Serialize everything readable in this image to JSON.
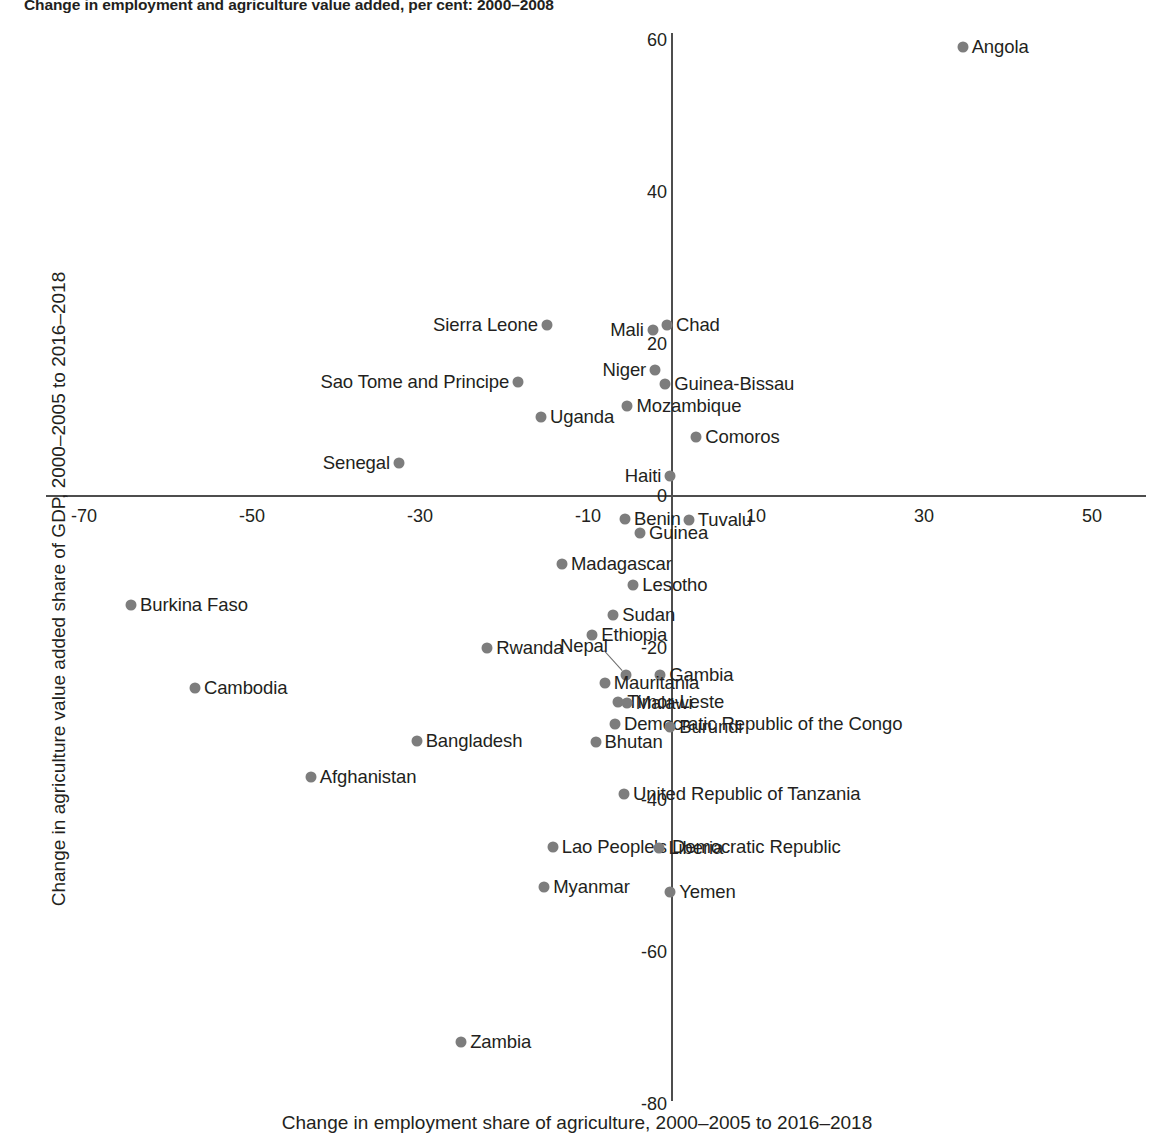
{
  "chart_data": {
    "type": "scatter",
    "title": "Change in employment and agriculture value added, per cent: 2000–2008",
    "xlabel": "Change in employment share of agriculture, 2000–2005 to 2016–2018",
    "ylabel": "Change in agriculture value added share of GDP, 2000–2005 to 2016–2018",
    "xlim": [
      -70,
      50
    ],
    "ylim": [
      -80,
      60
    ],
    "xticks": [
      -70,
      -50,
      -30,
      -10,
      10,
      30,
      50
    ],
    "yticks": [
      60,
      40,
      20,
      0,
      -20,
      -40,
      -60,
      -80
    ],
    "xtick_labels": [
      "-70",
      "-50",
      "-30",
      "-10",
      "10",
      "30",
      "50"
    ],
    "ytick_labels": [
      "60",
      "40",
      "20",
      "0",
      "-20",
      "-40",
      "-60",
      "-80"
    ],
    "grid": false,
    "legend": "none",
    "marker_color": "#7d7d7d",
    "axis_color": "#4d4d4d",
    "points": [
      {
        "name": "Angola",
        "x": 34.6,
        "y": 59.1,
        "label_side": "right"
      },
      {
        "name": "Chad",
        "x": -0.6,
        "y": 22.5,
        "label_side": "right"
      },
      {
        "name": "Sierra Leone",
        "x": -14.9,
        "y": 22.5,
        "label_side": "left"
      },
      {
        "name": "Mali",
        "x": -2.3,
        "y": 21.8,
        "label_side": "left"
      },
      {
        "name": "Niger",
        "x": -2.0,
        "y": 16.6,
        "label_side": "left"
      },
      {
        "name": "Guinea-Bissau",
        "x": -0.8,
        "y": 14.7,
        "label_side": "right"
      },
      {
        "name": "Sao Tome and Principe",
        "x": -18.3,
        "y": 15.0,
        "label_side": "left"
      },
      {
        "name": "Mozambique",
        "x": -5.3,
        "y": 11.8,
        "label_side": "right"
      },
      {
        "name": "Uganda",
        "x": -15.6,
        "y": 10.4,
        "label_side": "right"
      },
      {
        "name": "Comoros",
        "x": 2.9,
        "y": 7.8,
        "label_side": "right"
      },
      {
        "name": "Senegal",
        "x": -32.5,
        "y": 4.3,
        "label_side": "left"
      },
      {
        "name": "Haiti",
        "x": -0.2,
        "y": 2.6,
        "label_side": "left"
      },
      {
        "name": "Benin",
        "x": -5.6,
        "y": -3.0,
        "label_side": "right"
      },
      {
        "name": "Tuvalu",
        "x": 2.0,
        "y": -3.2,
        "label_side": "right"
      },
      {
        "name": "Guinea",
        "x": -3.8,
        "y": -4.9,
        "label_side": "right"
      },
      {
        "name": "Madagascar",
        "x": -13.1,
        "y": -9.0,
        "label_side": "right"
      },
      {
        "name": "Lesotho",
        "x": -4.6,
        "y": -11.7,
        "label_side": "right"
      },
      {
        "name": "Burkina Faso",
        "x": -64.4,
        "y": -14.3,
        "label_side": "right"
      },
      {
        "name": "Sudan",
        "x": -7.0,
        "y": -15.7,
        "label_side": "right"
      },
      {
        "name": "Ethiopia",
        "x": -9.5,
        "y": -18.3,
        "label_side": "right"
      },
      {
        "name": "Rwanda",
        "x": -22.0,
        "y": -20.0,
        "label_side": "right"
      },
      {
        "name": "Nepal",
        "x": -5.5,
        "y": -23.6,
        "label_side": "leader"
      },
      {
        "name": "Gambia",
        "x": -1.4,
        "y": -23.6,
        "label_side": "right"
      },
      {
        "name": "Mauritania",
        "x": -8.0,
        "y": -24.6,
        "label_side": "right"
      },
      {
        "name": "Cambodia",
        "x": -56.8,
        "y": -25.2,
        "label_side": "right"
      },
      {
        "name": "Timor-Leste",
        "x": -6.4,
        "y": -27.1,
        "label_side": "right"
      },
      {
        "name": "Malawi",
        "x": -5.4,
        "y": -27.2,
        "label_side": "right"
      },
      {
        "name": "Democratic Republic of the Congo",
        "x": -6.8,
        "y": -30.0,
        "label_side": "right"
      },
      {
        "name": "Burundi",
        "x": -0.2,
        "y": -30.4,
        "label_side": "right"
      },
      {
        "name": "Bangladesh",
        "x": -30.4,
        "y": -32.2,
        "label_side": "right"
      },
      {
        "name": "Bhutan",
        "x": -9.1,
        "y": -32.4,
        "label_side": "right"
      },
      {
        "name": "Afghanistan",
        "x": -43.0,
        "y": -37.0,
        "label_side": "right"
      },
      {
        "name": "United Republic of Tanzania",
        "x": -5.7,
        "y": -39.2,
        "label_side": "right"
      },
      {
        "name": "Lao People's Democratic Republic",
        "x": -14.2,
        "y": -46.2,
        "label_side": "right"
      },
      {
        "name": "Liberia",
        "x": -1.5,
        "y": -46.3,
        "label_side": "right"
      },
      {
        "name": "Myanmar",
        "x": -15.2,
        "y": -51.5,
        "label_side": "right"
      },
      {
        "name": "Yemen",
        "x": -0.2,
        "y": -52.1,
        "label_side": "right"
      },
      {
        "name": "Zambia",
        "x": -25.1,
        "y": -71.9,
        "label_side": "right"
      }
    ]
  }
}
